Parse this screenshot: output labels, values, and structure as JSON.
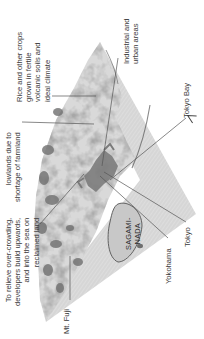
{
  "map": {
    "orientation": "rotated 90 degrees counter-clockwise",
    "colors": {
      "terrain_light": "#e6e6e6",
      "terrain_mid": "#bdbdbd",
      "terrain_dark": "#6e6e6e",
      "urban": "#7a7a7a",
      "sea": "#d2d2d2",
      "leader_line": "#555555",
      "text": "#3a3a3a"
    },
    "sea_label": [
      "SAGAMI-",
      "NADA"
    ],
    "north_arrow": "N",
    "callouts": [
      {
        "id": "rice",
        "lines": [
          "Rice and other crops",
          "grown in fertile",
          "volcanic soils and",
          "ideal climate"
        ]
      },
      {
        "id": "lowlands",
        "lines": [
          "lowlands due to",
          "shortage of farmland"
        ]
      },
      {
        "id": "industrial",
        "lines": [
          "Industrial and",
          "urban areas"
        ]
      },
      {
        "id": "tokyo-bay",
        "lines": [
          "Tokyo Bay"
        ]
      },
      {
        "id": "relieve",
        "lines": [
          "To relieve over-crowding,",
          "developers build upwards,",
          "and into the sea on",
          "reclaimed land"
        ]
      },
      {
        "id": "mt-fuji",
        "lines": [
          "Mt. Fuji"
        ]
      },
      {
        "id": "yokohama",
        "lines": [
          "Yokohama"
        ]
      },
      {
        "id": "tokyo",
        "lines": [
          "Tokyo"
        ]
      }
    ]
  }
}
